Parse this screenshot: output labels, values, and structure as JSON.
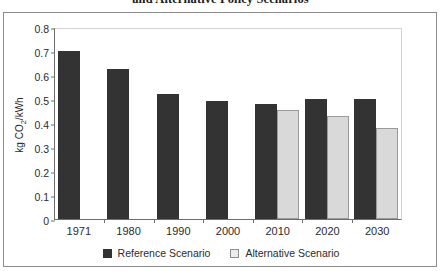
{
  "title": "and Alternative Policy Scenarios",
  "legend": {
    "items": [
      {
        "label": "Reference Scenario",
        "swatch": "dark-square-icon",
        "color": "#333333"
      },
      {
        "label": "Alternative Scenario",
        "swatch": "light-square-icon",
        "color": "#d9d9d9"
      }
    ]
  },
  "axis": {
    "y_title_prefix": "kg CO",
    "y_title_sub": "2",
    "y_title_suffix": "/kWh",
    "y_ticks": [
      "0.8",
      "0.7",
      "0.6",
      "0.5",
      "0.4",
      "0.3",
      "0.2",
      "0.1",
      "0"
    ]
  },
  "chart_data": {
    "type": "bar",
    "title": "and Alternative Policy Scenarios",
    "xlabel": "",
    "ylabel": "kg CO2/kWh",
    "ylim": [
      0,
      0.8
    ],
    "ytick_step": 0.1,
    "grid": false,
    "legend_position": "bottom-center",
    "categories": [
      "1971",
      "1980",
      "1990",
      "2000",
      "2010",
      "2020",
      "2030"
    ],
    "series": [
      {
        "name": "Reference Scenario",
        "color": "#333333",
        "values": [
          0.7,
          0.625,
          0.52,
          0.49,
          0.48,
          0.5,
          0.5
        ]
      },
      {
        "name": "Alternative Scenario",
        "color": "#d9d9d9",
        "values": [
          null,
          null,
          null,
          null,
          0.455,
          0.43,
          0.38
        ]
      }
    ]
  }
}
